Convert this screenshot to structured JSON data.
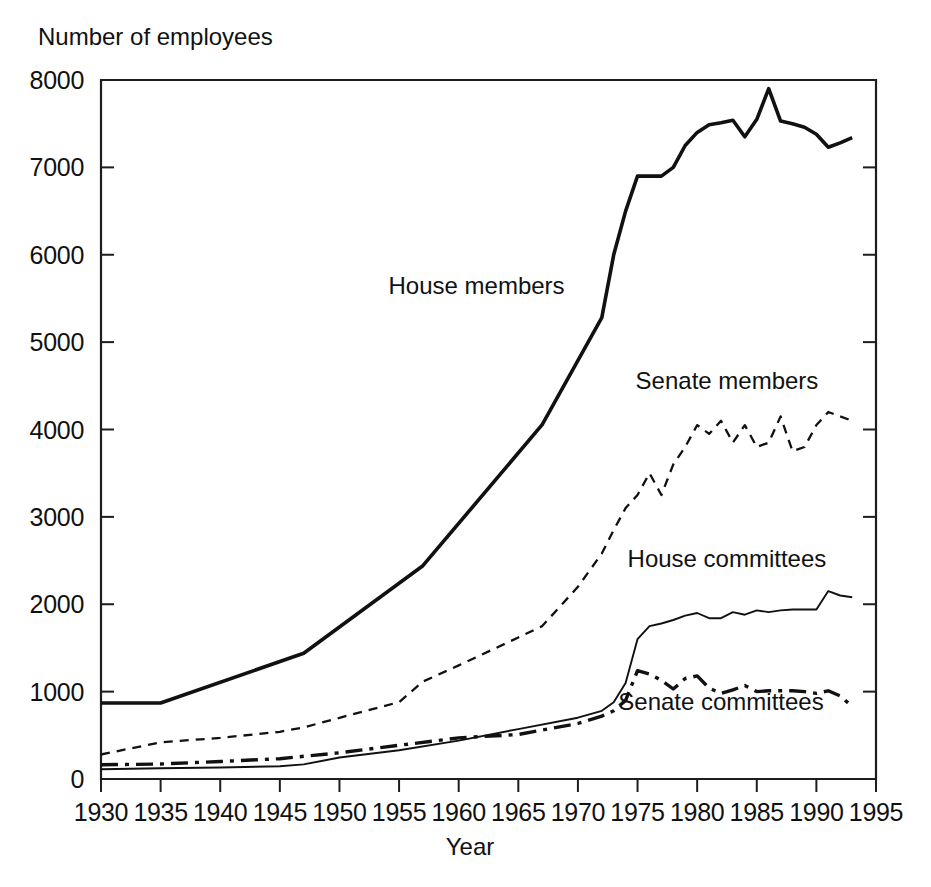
{
  "chart_data": {
    "type": "line",
    "title": "",
    "ylabel": "Number of employees",
    "xlabel": "Year",
    "xlim": [
      1930,
      1995
    ],
    "ylim": [
      0,
      8000
    ],
    "grid": false,
    "legend_position": "inline-annotations",
    "x_ticks": [
      1930,
      1935,
      1940,
      1945,
      1950,
      1955,
      1960,
      1965,
      1970,
      1975,
      1980,
      1985,
      1990,
      1995
    ],
    "y_ticks": [
      0,
      1000,
      2000,
      3000,
      4000,
      5000,
      6000,
      7000,
      8000
    ],
    "series": [
      {
        "name": "House members",
        "style": "solid-thick",
        "label_x": 1961.5,
        "label_y": 5550,
        "x": [
          1930,
          1935,
          1947,
          1957,
          1967,
          1972,
          1973,
          1974,
          1975,
          1976,
          1977,
          1978,
          1979,
          1980,
          1981,
          1982,
          1983,
          1984,
          1985,
          1986,
          1987,
          1988,
          1989,
          1990,
          1991,
          1992,
          1993
        ],
        "values": [
          870,
          870,
          1440,
          2441,
          4055,
          5280,
          6000,
          6500,
          6900,
          6900,
          6900,
          7000,
          7250,
          7400,
          7487,
          7511,
          7540,
          7350,
          7550,
          7900,
          7530,
          7500,
          7460,
          7380,
          7230,
          7280,
          7340
        ]
      },
      {
        "name": "Senate members",
        "style": "dashed",
        "label_x": 1982.5,
        "label_y": 4460,
        "x": [
          1930,
          1935,
          1940,
          1945,
          1947,
          1950,
          1955,
          1957,
          1960,
          1965,
          1967,
          1970,
          1972,
          1973,
          1974,
          1975,
          1976,
          1977,
          1978,
          1979,
          1980,
          1981,
          1982,
          1983,
          1984,
          1985,
          1986,
          1987,
          1988,
          1989,
          1990,
          1991,
          1992,
          1993
        ],
        "values": [
          280,
          420,
          470,
          540,
          590,
          700,
          880,
          1115,
          1300,
          1620,
          1750,
          2200,
          2580,
          2850,
          3100,
          3250,
          3500,
          3250,
          3600,
          3800,
          4050,
          3950,
          4100,
          3850,
          4050,
          3800,
          3850,
          4150,
          3750,
          3800,
          4050,
          4200,
          4150,
          4100
        ]
      },
      {
        "name": "House committees",
        "style": "solid-thin",
        "label_x": 1982.5,
        "label_y": 2430,
        "x": [
          1930,
          1935,
          1940,
          1945,
          1947,
          1950,
          1955,
          1960,
          1965,
          1970,
          1972,
          1973,
          1974,
          1975,
          1976,
          1977,
          1978,
          1979,
          1980,
          1981,
          1982,
          1983,
          1984,
          1985,
          1986,
          1987,
          1988,
          1989,
          1990,
          1991,
          1992,
          1993
        ],
        "values": [
          112,
          122,
          132,
          146,
          167,
          246,
          329,
          440,
          571,
          702,
          780,
          878,
          1100,
          1600,
          1750,
          1780,
          1820,
          1870,
          1900,
          1840,
          1840,
          1910,
          1880,
          1930,
          1910,
          1930,
          1940,
          1940,
          1940,
          2150,
          2100,
          2080
        ]
      },
      {
        "name": "Senate committees",
        "style": "dash-dot",
        "label_x": 1982.0,
        "label_y": 790,
        "x": [
          1930,
          1935,
          1940,
          1945,
          1947,
          1950,
          1955,
          1960,
          1965,
          1970,
          1972,
          1973,
          1974,
          1975,
          1976,
          1977,
          1978,
          1979,
          1980,
          1981,
          1982,
          1983,
          1984,
          1985,
          1986,
          1987,
          1988,
          1989,
          1990,
          1991,
          1992,
          1993
        ],
        "values": [
          163,
          172,
          200,
          232,
          260,
          300,
          386,
          470,
          509,
          635,
          720,
          780,
          900,
          1240,
          1200,
          1130,
          1030,
          1150,
          1180,
          1040,
          980,
          1020,
          1070,
          1000,
          1010,
          1010,
          1010,
          1000,
          980,
          1010,
          950,
          830
        ]
      }
    ]
  },
  "labels": {
    "y_axis_title": "Number of employees",
    "x_axis_title": "Year",
    "series_house_members": "House members",
    "series_senate_members": "Senate members",
    "series_house_committees": "House committees",
    "series_senate_committees": "Senate committees"
  },
  "colors": {
    "ink": "#111111",
    "background": "#ffffff"
  }
}
